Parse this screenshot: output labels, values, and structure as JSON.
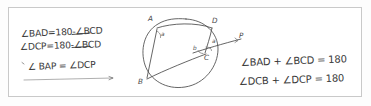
{
  "canvas": {
    "width": 371,
    "height": 106,
    "background_color": "#fdfdfd",
    "frame_border_color": "#c9c9c9",
    "ink_color": "#3a3a3a"
  },
  "left_work": {
    "name": "handwritten-derivation",
    "lines": [
      {
        "id": "l1",
        "text": "∠BAD=180-∠BCD",
        "struck_through": true
      },
      {
        "id": "l2",
        "text": "∠DCP=180-∠BCD",
        "struck_through": true
      },
      {
        "id": "l3",
        "text": "∠ BAP = ∠DCP",
        "struck_through": false
      }
    ],
    "underline_present": true
  },
  "diagram": {
    "name": "cyclic-quadrilateral-tangent-diagram",
    "shape": "circle",
    "points": [
      {
        "label": "A",
        "x": 152,
        "y": 22
      },
      {
        "label": "D",
        "x": 214,
        "y": 24
      },
      {
        "label": "P",
        "x": 238,
        "y": 45
      },
      {
        "label": "C",
        "x": 206,
        "y": 55
      },
      {
        "label": "B",
        "x": 143,
        "y": 82
      }
    ],
    "angle_marks": [
      {
        "label": "a",
        "at": "A",
        "x": 159,
        "y": 34
      },
      {
        "label": "a",
        "at": "C",
        "x": 212,
        "y": 43
      },
      {
        "label": "b",
        "at": "C",
        "x": 196,
        "y": 48
      }
    ],
    "chords": [
      "A-B",
      "A-D",
      "D-C",
      "B-C",
      "B-P-line"
    ],
    "tangent_line_label": "P"
  },
  "right_work": {
    "name": "handwritten-conclusions",
    "lines": [
      {
        "id": "r1",
        "text": "∠BAD + ∠BCD = 180"
      },
      {
        "id": "r2",
        "text": "∠DCB + ∠DCP = 180"
      }
    ]
  }
}
